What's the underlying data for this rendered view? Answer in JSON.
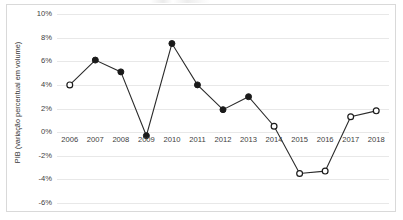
{
  "chart_data": {
    "type": "line",
    "title": "",
    "subtitle": "",
    "xlabel": "",
    "ylabel": "PIB (variação percentual em volume)",
    "categories": [
      "2006",
      "2007",
      "2008",
      "2009",
      "2010",
      "2011",
      "2012",
      "2013",
      "2014",
      "2015",
      "2016",
      "2017",
      "2018"
    ],
    "values": [
      4.0,
      6.1,
      5.1,
      -0.3,
      7.5,
      4.0,
      1.9,
      3.0,
      0.5,
      -3.5,
      -3.3,
      1.3,
      1.8
    ],
    "marker_styles": [
      "hollow",
      "filled",
      "filled",
      "filled",
      "filled",
      "filled",
      "filled",
      "filled",
      "hollow",
      "hollow",
      "hollow",
      "hollow",
      "hollow"
    ],
    "ylim": [
      -6,
      10
    ],
    "ytick_values": [
      10,
      8,
      6,
      4,
      2,
      0,
      -2,
      -4,
      -6
    ],
    "ytick_labels": [
      "10%",
      "8%",
      "6%",
      "4%",
      "2%",
      "0%",
      "-2%",
      "-4%",
      "-6%"
    ],
    "xtick_labels": [
      "2006",
      "2007",
      "2008",
      "2009",
      "2010",
      "2011",
      "2012",
      "2013",
      "2014",
      "2015",
      "2016",
      "2017",
      "2018"
    ],
    "xaxis_label_baseline_value": 0,
    "grid": true,
    "grid_color": "#e8e8e8",
    "legend": false,
    "legend_position": "none",
    "series": [
      {
        "name": "PIB",
        "values": [
          4.0,
          6.1,
          5.1,
          -0.3,
          7.5,
          4.0,
          1.9,
          3.0,
          0.5,
          -3.5,
          -3.3,
          1.3,
          1.8
        ]
      }
    ],
    "line_color": "#2b2b2b",
    "marker_fill_color": "#1a1a1a",
    "marker_hollow_color": "#ffffff",
    "border_color": "#d9d9d9",
    "background_color": "#ffffff",
    "text_color": "#404040"
  }
}
